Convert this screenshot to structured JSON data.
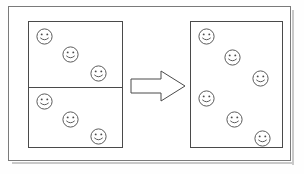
{
  "diagram": {
    "stroke_color": "#4a4a4a",
    "frame_color": "#7a7a7a",
    "background_color": "#ffffff",
    "face_icon_name": "smiley-face-icon",
    "arrow_icon_name": "right-arrow-icon",
    "arrow_direction": "right",
    "left_container": {
      "label": "divided-box",
      "divided": true,
      "divider_count": 1,
      "total_faces": 6,
      "sections": [
        {
          "label": "top-section",
          "face_count": 3,
          "faces": [
            {
              "id": "L1",
              "x": 36,
              "y": 28
            },
            {
              "id": "L2",
              "x": 62,
              "y": 46
            },
            {
              "id": "L3",
              "x": 90,
              "y": 65
            }
          ]
        },
        {
          "label": "bottom-section",
          "face_count": 3,
          "faces": [
            {
              "id": "L4",
              "x": 36,
              "y": 93
            },
            {
              "id": "L5",
              "x": 62,
              "y": 111
            },
            {
              "id": "L6",
              "x": 90,
              "y": 128
            }
          ]
        }
      ]
    },
    "right_container": {
      "label": "single-box",
      "divided": false,
      "divider_count": 0,
      "total_faces": 6,
      "sections": [
        {
          "label": "whole-section",
          "face_count": 6,
          "faces": [
            {
              "id": "R1",
              "x": 198,
              "y": 28
            },
            {
              "id": "R2",
              "x": 224,
              "y": 49
            },
            {
              "id": "R3",
              "x": 252,
              "y": 70
            },
            {
              "id": "R4",
              "x": 198,
              "y": 90
            },
            {
              "id": "R5",
              "x": 226,
              "y": 111
            },
            {
              "id": "R6",
              "x": 254,
              "y": 130
            }
          ]
        }
      ]
    }
  }
}
